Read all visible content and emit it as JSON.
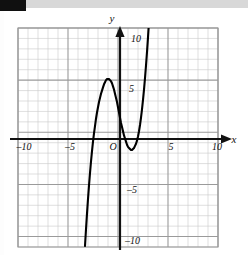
{
  "figure": {
    "label_block": "",
    "kind": "cartesian-graph",
    "background": "#ffffff",
    "curve_color": "#000000",
    "axis_color": "#111111",
    "grid_major_color": "#9a9a9a",
    "grid_minor_color": "#c9c9c9"
  },
  "axes": {
    "x_name": "x",
    "y_name": "y",
    "origin_label": "O",
    "x_tick_labels": [
      {
        "value": -10,
        "text": "–10"
      },
      {
        "value": -5,
        "text": "–5"
      },
      {
        "value": 5,
        "text": "5"
      },
      {
        "value": 10,
        "text": "10"
      }
    ],
    "y_tick_labels": [
      {
        "value": 10,
        "text": "10"
      },
      {
        "value": 5,
        "text": "5"
      },
      {
        "value": -5,
        "text": "–5"
      },
      {
        "value": -10,
        "text": "–10"
      }
    ]
  },
  "chart_data": {
    "type": "line",
    "title": "",
    "xlabel": "x",
    "ylabel": "y",
    "xlim": [
      -10,
      10
    ],
    "ylim": [
      -11,
      10
    ],
    "grid": true,
    "grid_major_step": 5,
    "grid_minor_step": 1,
    "legend": "none",
    "annotations": [],
    "series": [
      {
        "name": "cubic",
        "roots": [
          -2.5,
          0.7,
          3.0
        ],
        "local_max": {
          "x": -1.0,
          "y": 6.1
        },
        "local_min": {
          "x": 2.0,
          "y": -1.6
        },
        "x": [
          -3.3,
          -3.2,
          -3.1,
          -3.0,
          -2.9,
          -2.8,
          -2.7,
          -2.6,
          -2.5,
          -2.4,
          -2.3,
          -2.2,
          -2.1,
          -2.0,
          -1.9,
          -1.8,
          -1.7,
          -1.6,
          -1.5,
          -1.4,
          -1.3,
          -1.2,
          -1.1,
          -1.0,
          -0.9,
          -0.8,
          -0.7,
          -0.6,
          -0.5,
          -0.4,
          -0.3,
          -0.2,
          -0.1,
          0.0,
          0.1,
          0.2,
          0.3,
          0.4,
          0.5,
          0.6,
          0.7,
          0.8,
          0.9,
          1.0,
          1.1,
          1.2,
          1.3,
          1.4,
          1.5,
          1.6,
          1.7,
          1.8,
          1.9,
          2.0,
          2.1,
          2.2,
          2.3,
          2.4,
          2.5,
          2.6,
          2.7,
          2.8,
          2.9,
          3.0,
          3.1,
          3.2,
          3.3,
          3.4,
          3.5,
          3.6,
          3.7,
          3.8,
          3.9,
          4.0,
          4.1
        ],
        "y": [
          -10.9,
          -9.3,
          -7.8,
          -6.4,
          -5.1,
          -3.9,
          -2.8,
          -1.8,
          -0.9,
          -0.1,
          0.6,
          1.3,
          1.9,
          2.4,
          2.9,
          3.3,
          3.7,
          4.0,
          4.3,
          4.6,
          4.8,
          5.0,
          5.1,
          5.1,
          5.1,
          5.0,
          4.9,
          4.7,
          4.4,
          4.1,
          3.7,
          3.3,
          2.9,
          2.4,
          1.9,
          1.4,
          0.9,
          0.5,
          0.1,
          -0.3,
          -0.6,
          -0.9,
          -1.2,
          -1.4,
          -1.5,
          -1.6,
          -1.7,
          -1.7,
          -1.6,
          -1.5,
          -1.3,
          -1.1,
          -0.8,
          -0.4,
          0.1,
          0.7,
          1.4,
          2.2,
          3.1,
          4.1,
          5.2,
          6.4,
          7.7,
          9.1,
          10.6,
          12.2,
          13.9,
          15.7,
          17.6,
          19.6,
          21.7,
          23.9,
          26.2,
          28.6,
          31.1
        ]
      }
    ]
  }
}
